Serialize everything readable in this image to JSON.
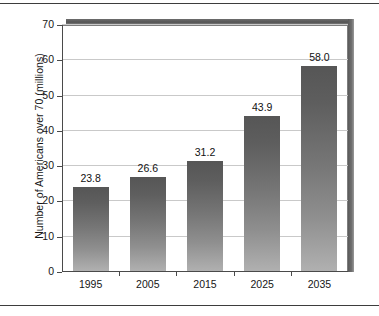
{
  "chart_data": {
    "type": "bar",
    "title": "",
    "subtitle": "",
    "xlabel": "",
    "ylabel": "Number of Americans over 70 (millions)",
    "categories": [
      "1995",
      "2005",
      "2015",
      "2025",
      "2035"
    ],
    "values": [
      23.8,
      26.6,
      31.2,
      43.9,
      58.0
    ],
    "value_labels": [
      "23.8",
      "26.6",
      "31.2",
      "43.9",
      "58.0"
    ],
    "ylim": [
      0,
      70
    ],
    "ytick_labels": [
      "0",
      "10",
      "20",
      "30",
      "40",
      "50",
      "60",
      "70"
    ],
    "ytick_values": [
      0,
      10,
      20,
      30,
      40,
      50,
      60,
      70
    ],
    "grid": "horizontal",
    "legend": "none",
    "bar_color_top": "#565656",
    "bar_color_bottom": "#b0b0b0",
    "gridline_color": "#c9c9c9",
    "axis_color": "#4a4a4a",
    "frame_color": "#7d7d7d",
    "shadow_color": "#5a5a5a",
    "text_color": "#161616"
  }
}
